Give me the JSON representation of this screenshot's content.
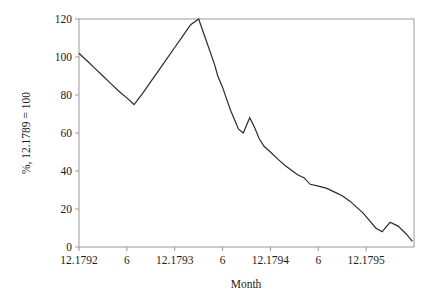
{
  "chart_data": {
    "type": "line",
    "title": "",
    "subtitle": "",
    "xlabel": "Month",
    "ylabel": "%, 12.1789 = 100",
    "xlim": [
      0,
      42
    ],
    "ylim": [
      0,
      120
    ],
    "grid": false,
    "legend": null,
    "x_tick_positions": [
      0,
      6,
      12,
      18,
      24,
      30,
      36
    ],
    "x_tick_labels": [
      "12.1792",
      "6",
      "12.1793",
      "6",
      "12.1794",
      "6",
      "12.1795"
    ],
    "y_tick_values": [
      0,
      20,
      40,
      60,
      80,
      100,
      120
    ],
    "y_tick_labels": [
      "0",
      "20",
      "40",
      "60",
      "80",
      "100",
      "120"
    ],
    "line_color": "#2b2b2b",
    "axis_color": "#9a9a9a",
    "background_color": "#ffffff",
    "series": [
      {
        "name": "index",
        "x": [
          0.0,
          1.0,
          2.0,
          3.0,
          4.0,
          5.0,
          6.0,
          6.9,
          8.0,
          9.0,
          10.0,
          11.0,
          12.0,
          13.0,
          14.0,
          15.0,
          16.0,
          17.0,
          17.4,
          18.0,
          19.0,
          20.0,
          20.6,
          21.4,
          22.0,
          22.6,
          23.2,
          24.0,
          25.0,
          25.8,
          26.6,
          27.4,
          28.2,
          29.0,
          30.0,
          31.0,
          32.0,
          33.0,
          34.0,
          34.8,
          35.6,
          36.4,
          37.2,
          38.0,
          39.0,
          40.0,
          41.0,
          41.8
        ],
        "y": [
          102.0,
          98.0,
          94.0,
          90.0,
          86.0,
          82.0,
          78.5,
          75.0,
          81.0,
          87.0,
          93.0,
          99.0,
          105.0,
          111.0,
          117.0,
          120.0,
          108.0,
          96.0,
          90.0,
          84.0,
          72.0,
          62.0,
          60.0,
          68.0,
          63.0,
          57.0,
          53.0,
          50.0,
          46.0,
          43.0,
          40.5,
          38.0,
          36.5,
          33.0,
          32.0,
          31.0,
          29.0,
          27.0,
          24.0,
          21.0,
          18.0,
          14.0,
          10.0,
          8.0,
          13.0,
          11.0,
          7.0,
          3.0
        ]
      }
    ]
  },
  "axes": {
    "x_title": "Month",
    "y_title": "%, 12.1789 = 100"
  }
}
